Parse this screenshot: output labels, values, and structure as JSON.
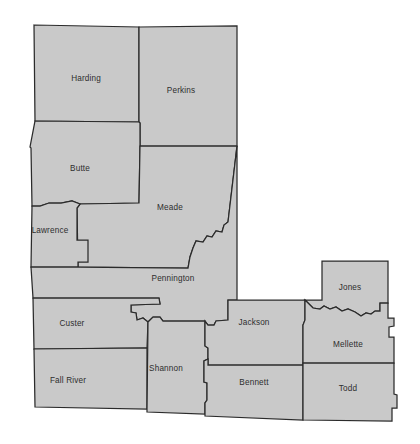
{
  "map": {
    "type": "county-outline-map",
    "region": "Western South Dakota",
    "background_color": "#ffffff",
    "fill_color": "#c9c9c9",
    "border_color": "#2b2b2b",
    "label_color": "#2e2e2e",
    "counties": [
      {
        "name": "Harding",
        "label_x": 86,
        "label_y": 79,
        "path": "M 34,25 L 139,27 L 139,122 L 35,121 Z"
      },
      {
        "name": "Perkins",
        "label_x": 181,
        "label_y": 91,
        "path": "M 139,27 L 237,26 L 237,146 L 140,146 L 140,123 L 139,122 Z"
      },
      {
        "name": "Butte",
        "label_x": 80,
        "label_y": 169,
        "path": "M 35,121 L 139,122 L 140,123 L 140,146 L 139,203 L 80,204 L 72,201 L 61,203 L 49,203 L 40,206 L 32,206 L 31,148 L 30,147 Z"
      },
      {
        "name": "Meade",
        "label_x": 170,
        "label_y": 208,
        "path": "M 140,146 L 237,146 L 228,222 L 224,225 L 222,232 L 216,231 L 212,237 L 207,236 L 203,242 L 196,241 L 193,248 L 190,257 L 188,268 L 78,267 L 77,208 L 80,204 L 139,203 Z"
      },
      {
        "name": "Lawrence",
        "label_x": 50,
        "label_y": 231,
        "path": "M 32,206 L 40,206 L 49,203 L 61,203 L 72,201 L 80,204 L 77,208 L 77,240 L 88,240 L 88,262 L 78,262 L 78,267 L 31,267 Z"
      },
      {
        "name": "Pennington",
        "label_x": 173,
        "label_y": 279,
        "path": "M 31,267 L 78,267 L 188,268 L 190,257 L 193,248 L 196,241 L 203,242 L 207,236 L 212,237 L 216,231 L 222,232 L 224,225 L 228,222 L 237,146 L 237,300 L 228,300 L 228,320 L 216,321 L 214,325 L 208,325 L 205,321 L 163,321 L 160,317 L 153,317 L 148,322 L 143,318 L 137,320 L 136,313 L 131,312 L 131,305 L 160,304 L 159,298 L 33,298 Z"
      },
      {
        "name": "Custer",
        "label_x": 72,
        "label_y": 324,
        "path": "M 33,298 L 159,298 L 160,304 L 131,305 L 131,312 L 136,313 L 137,320 L 143,318 L 148,322 L 147,348 L 34,349 Z"
      },
      {
        "name": "Fall River",
        "label_x": 68,
        "label_y": 381,
        "path": "M 34,349 L 147,348 L 147,409 L 35,407 Z"
      },
      {
        "name": "Shannon",
        "label_x": 166,
        "label_y": 369,
        "path": "M 148,322 L 153,317 L 160,317 L 163,321 L 205,321 L 205,346 L 208,348 L 208,359 L 204,361 L 204,382 L 207,383 L 207,400 L 205,403 L 205,414 L 147,412 L 147,409 Z"
      },
      {
        "name": "Jackson",
        "label_x": 254,
        "label_y": 323,
        "path": "M 228,300 L 305,300 L 305,320 L 303,325 L 303,365 L 208,365 L 208,359 L 208,348 L 205,346 L 205,321 L 208,325 L 214,325 L 216,321 L 228,320 Z"
      },
      {
        "name": "Bennett",
        "label_x": 254,
        "label_y": 383,
        "path": "M 208,365 L 303,365 L 303,420 L 205,416 L 205,414 L 205,403 L 207,400 L 207,383 L 204,382 L 204,361 L 208,359 Z"
      },
      {
        "name": "Jones",
        "label_x": 350,
        "label_y": 288,
        "path": "M 322,261 L 388,261 L 388,303 L 380,303 L 380,311 L 375,311 L 371,314 L 366,313 L 361,316 L 355,312 L 348,309 L 342,311 L 336,307 L 330,309 L 324,306 L 320,309 L 313,308 L 305,300 L 322,300 Z"
      },
      {
        "name": "Mellette",
        "label_x": 348,
        "label_y": 345,
        "path": "M 305,300 L 313,308 L 320,309 L 324,306 L 330,309 L 336,307 L 342,311 L 348,309 L 355,312 L 361,316 L 366,313 L 371,314 L 375,311 L 380,311 L 380,303 L 388,303 L 388,318 L 394,318 L 394,326 L 389,327 L 389,337 L 394,337 L 394,363 L 303,363 L 303,325 L 305,320 Z"
      },
      {
        "name": "Todd",
        "label_x": 348,
        "label_y": 389,
        "path": "M 303,363 L 394,363 L 394,394 L 397,395 L 397,408 L 392,408 L 392,421 L 303,420 Z"
      }
    ]
  }
}
